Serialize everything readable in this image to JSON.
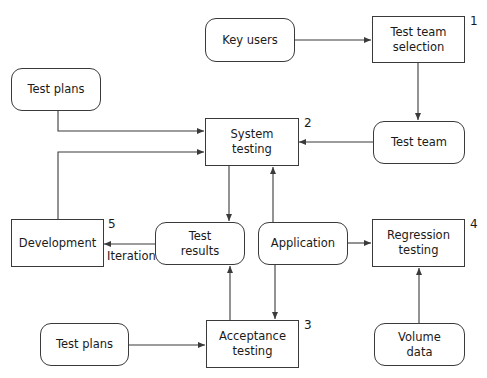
{
  "diagram": {
    "nodes": {
      "key_users": {
        "label": "Key users",
        "shape": "rounded"
      },
      "test_team_selection": {
        "label": "Test team\nselection",
        "shape": "rect",
        "step": "1"
      },
      "test_plans_top": {
        "label": "Test plans",
        "shape": "rounded"
      },
      "system_testing": {
        "label": "System\ntesting",
        "shape": "rect",
        "step": "2"
      },
      "test_team": {
        "label": "Test team",
        "shape": "rounded"
      },
      "development": {
        "label": "Development",
        "shape": "rect",
        "step": "5"
      },
      "test_results": {
        "label": "Test\nresults",
        "shape": "rounded"
      },
      "application": {
        "label": "Application",
        "shape": "rounded"
      },
      "regression_testing": {
        "label": "Regression\ntesting",
        "shape": "rect",
        "step": "4"
      },
      "test_plans_bottom": {
        "label": "Test plans",
        "shape": "rounded"
      },
      "acceptance_testing": {
        "label": "Acceptance\ntesting",
        "shape": "rect",
        "step": "3"
      },
      "volume_data": {
        "label": "Volume\ndata",
        "shape": "rounded"
      }
    },
    "edge_labels": {
      "iteration": "Iteration"
    },
    "edges": [
      {
        "from": "Key users",
        "to": "Test team selection"
      },
      {
        "from": "Test team selection",
        "to": "Test team"
      },
      {
        "from": "Test team",
        "to": "System testing"
      },
      {
        "from": "Test plans",
        "to": "System testing"
      },
      {
        "from": "Development",
        "to": "System testing"
      },
      {
        "from": "System testing",
        "to": "Test results"
      },
      {
        "from": "Application",
        "to": "System testing"
      },
      {
        "from": "Application",
        "to": "Acceptance testing"
      },
      {
        "from": "Application",
        "to": "Regression testing"
      },
      {
        "from": "Acceptance testing",
        "to": "Test results"
      },
      {
        "from": "Test results",
        "to": "Development",
        "label": "Iteration"
      },
      {
        "from": "Test plans",
        "to": "Acceptance testing"
      },
      {
        "from": "Volume data",
        "to": "Regression testing"
      }
    ],
    "colors": {
      "stroke": "#3a3a3a",
      "background": "#ffffff",
      "text": "#1a1a1a"
    }
  }
}
